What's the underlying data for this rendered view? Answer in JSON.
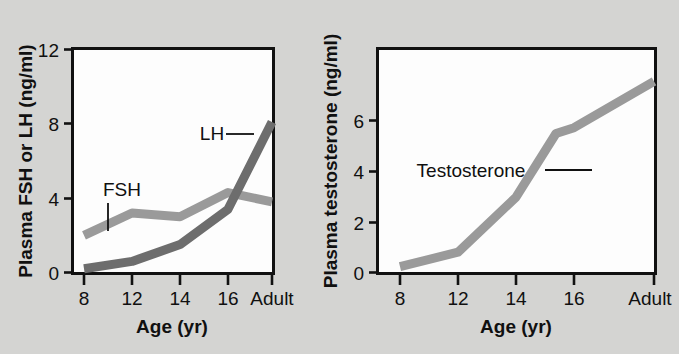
{
  "figure": {
    "background_color": "#d4d4d2",
    "panel_background": "#fdfdfd",
    "axis_color": "#111111"
  },
  "chart_data": [
    {
      "type": "line",
      "panel": "left",
      "title": "",
      "xlabel": "Age (yr)",
      "ylabel": "Plasma FSH or LH (ng/ml)",
      "x": [
        8,
        12,
        14,
        16,
        "Adult"
      ],
      "xtick_labels": [
        "8",
        "12",
        "14",
        "16",
        "Adult"
      ],
      "ytick_labels": [
        "0",
        "4",
        "8",
        "12"
      ],
      "yticks": [
        0,
        4,
        8,
        12
      ],
      "ylim": [
        0,
        12
      ],
      "grid": false,
      "legend": "inline-annotations",
      "series": [
        {
          "name": "FSH",
          "label": "FSH",
          "color": "#9a9a9a",
          "values": [
            2.0,
            3.2,
            3.0,
            4.3,
            3.8
          ]
        },
        {
          "name": "LH",
          "label": "LH",
          "color": "#6d6d6d",
          "values": [
            0.2,
            0.6,
            1.5,
            3.4,
            8.1
          ]
        }
      ]
    },
    {
      "type": "line",
      "panel": "right",
      "title": "",
      "xlabel": "Age (yr)",
      "ylabel": "Plasma testosterone (ng/ml)",
      "x": [
        8,
        12,
        14,
        16,
        "Adult"
      ],
      "xtick_labels": [
        "8",
        "12",
        "14",
        "16",
        "Adult"
      ],
      "ytick_labels": [
        "0",
        "2",
        "4",
        "6"
      ],
      "yticks": [
        0,
        2,
        4,
        6
      ],
      "ylim": [
        0,
        7.7
      ],
      "grid": false,
      "legend": "inline-annotations",
      "series": [
        {
          "name": "Testosterone",
          "label": "Testosterone",
          "color": "#9a9a9a",
          "values": [
            0.2,
            0.7,
            2.6,
            5.0,
            6.6
          ]
        }
      ]
    }
  ],
  "left_panel": {
    "y_axis_title": "Plasma FSH or LH (ng/ml)",
    "x_axis_title": "Age (yr)",
    "y_ticks": [
      "12",
      "8",
      "4",
      "0"
    ],
    "x_ticks": [
      "8",
      "12",
      "14",
      "16",
      "Adult"
    ],
    "annotations": [
      {
        "name": "fsh",
        "text": "FSH"
      },
      {
        "name": "lh",
        "text": "LH"
      }
    ]
  },
  "right_panel": {
    "y_axis_title": "Plasma testosterone (ng/ml)",
    "x_axis_title": "Age (yr)",
    "y_ticks": [
      "6",
      "4",
      "2",
      "0"
    ],
    "x_ticks": [
      "8",
      "12",
      "14",
      "16",
      "Adult"
    ],
    "annotations": [
      {
        "name": "testosterone",
        "text": "Testosterone"
      }
    ]
  }
}
